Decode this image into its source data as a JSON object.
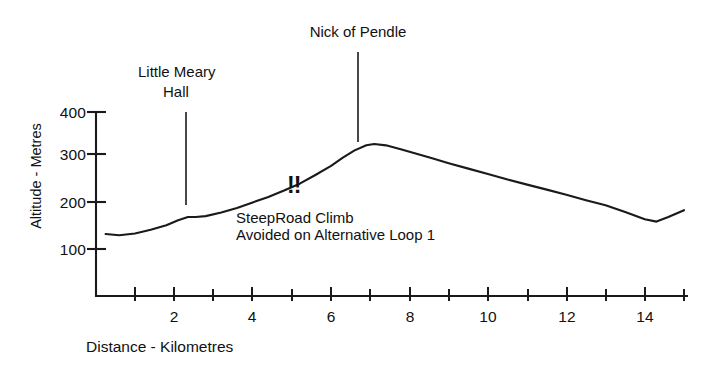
{
  "chart_data": {
    "type": "line",
    "title": "",
    "subtitle": "",
    "xlabel": "Distance - Kilometres",
    "ylabel": "Altitude - Metres",
    "xlim": [
      0,
      15.3
    ],
    "ylim": [
      -35,
      415
    ],
    "grid": false,
    "legend": null,
    "x_ticks": [
      1,
      2,
      3,
      4,
      5,
      6,
      7,
      8,
      9,
      10,
      11,
      12,
      13,
      14,
      15
    ],
    "x_tick_labels": [
      "",
      "2",
      "",
      "4",
      "",
      "6",
      "",
      "8",
      "",
      "10",
      "",
      "12",
      "",
      "14",
      ""
    ],
    "y_ticks": [
      100,
      200,
      300,
      400
    ],
    "y_tick_labels": [
      "100",
      "200",
      "300",
      "400"
    ],
    "line_color": "#1a1a1a",
    "series": [
      {
        "name": "Elevation profile",
        "x": [
          0.25,
          0.6,
          1.0,
          1.4,
          1.8,
          2.1,
          2.35,
          2.55,
          2.8,
          3.2,
          3.6,
          4.0,
          4.4,
          4.8,
          5.2,
          5.6,
          6.0,
          6.3,
          6.6,
          6.9,
          7.1,
          7.4,
          7.8,
          8.2,
          8.6,
          9.0,
          9.5,
          10.0,
          10.5,
          11.0,
          11.5,
          12.0,
          12.5,
          13.0,
          13.5,
          14.0,
          14.3,
          14.6,
          15.0
        ],
        "y": [
          133,
          130,
          134,
          142,
          152,
          163,
          170,
          170,
          172,
          180,
          190,
          202,
          214,
          228,
          243,
          262,
          282,
          300,
          316,
          327,
          330,
          327,
          318,
          308,
          298,
          288,
          276,
          264,
          252,
          241,
          230,
          219,
          207,
          196,
          181,
          165,
          160,
          170,
          185
        ]
      }
    ],
    "annotations": [
      {
        "name": "nick-of-pendle",
        "label": "Nick of Pendle",
        "x_km": 7.1,
        "y_metres": 330,
        "leader": true
      },
      {
        "name": "little-meary-hall",
        "label_line1": "Little Meary",
        "label_line2": "Hall",
        "x_km": 2.5,
        "y_metres": 170,
        "leader": true
      },
      {
        "name": "steep-road-climb",
        "marker": "!!",
        "label_line1": "SteepRoad Climb",
        "label_line2": "Avoided on Alternative Loop 1",
        "x_km": 5.0
      }
    ]
  },
  "axes": {
    "y_title": "Altitude - Metres",
    "x_title": "Distance - Kilometres",
    "y_labels": [
      "400",
      "300",
      "200",
      "100"
    ],
    "x_labels": [
      "2",
      "4",
      "6",
      "8",
      "10",
      "12",
      "14"
    ]
  },
  "labels": {
    "nick_of_pendle": "Nick of Pendle",
    "little_meary_hall_line1": "Little Meary",
    "little_meary_hall_line2": "Hall",
    "bangs": "!!",
    "steep_road_climb": "SteepRoad Climb",
    "avoided_on_alt_loop": "Avoided on Alternative Loop 1"
  }
}
